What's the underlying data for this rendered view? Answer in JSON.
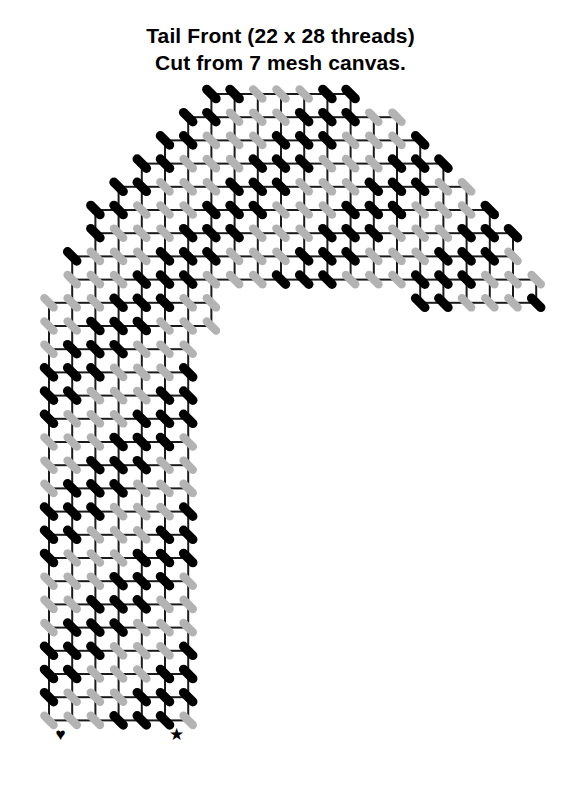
{
  "title": {
    "line1": "Tail Front (22 x 28 threads)",
    "line2": "Cut from 7 mesh canvas."
  },
  "legend": {
    "heart_symbol": "♥",
    "star_symbol": "★"
  },
  "colors": {
    "grid_line": "#1a1a1a",
    "stitch_dark": "#000000",
    "stitch_light": "#b3b3b3",
    "cell_fill": "#ffffff",
    "background": "#ffffff",
    "text": "#000000"
  },
  "chart_data": {
    "type": "heatmap",
    "title": "Tail Front (22 x 28 threads)",
    "subtitle": "Cut from 7 mesh canvas.",
    "shape": "candy-cane",
    "grid_columns": 22,
    "grid_rows": 28,
    "cell_size_px": 23.2,
    "origin_x_px": 49,
    "origin_y_px": 94,
    "mesh": "7 mesh canvas",
    "legend_entries": [
      {
        "symbol": "♥",
        "name": "heart-marker",
        "column": 0
      },
      {
        "symbol": "★",
        "name": "star-marker",
        "column": 5
      }
    ],
    "stitch_orientation": "diagonal NW-SE at grid intersections",
    "stripe_period_rows": 6,
    "shape_mask_rows": [
      {
        "row": 0,
        "start": 7,
        "end": 13
      },
      {
        "row": 1,
        "start": 6,
        "end": 15
      },
      {
        "row": 2,
        "start": 5,
        "end": 16
      },
      {
        "row": 3,
        "start": 4,
        "end": 17
      },
      {
        "row": 4,
        "start": 3,
        "end": 18
      },
      {
        "row": 5,
        "start": 2,
        "end": 19
      },
      {
        "row": 6,
        "start": 2,
        "end": 20
      },
      {
        "row": 7,
        "start": 1,
        "end": 20
      },
      {
        "row": 8,
        "start": 1,
        "end": 21,
        "hole_start": 7,
        "hole_end": 16
      },
      {
        "row": 9,
        "start": 0,
        "end": 7,
        "hole_start": 7,
        "hole_end": 21
      },
      {
        "row": 10,
        "start": 0,
        "end": 6,
        "hole_start": 6,
        "hole_end": 21
      },
      {
        "row": 11,
        "start": 0,
        "end": 6
      },
      {
        "row": 12,
        "start": 0,
        "end": 6
      },
      {
        "row": 13,
        "start": 0,
        "end": 6
      },
      {
        "row": 14,
        "start": 0,
        "end": 6
      },
      {
        "row": 15,
        "start": 0,
        "end": 6
      },
      {
        "row": 16,
        "start": 0,
        "end": 6
      },
      {
        "row": 17,
        "start": 0,
        "end": 6
      },
      {
        "row": 18,
        "start": 0,
        "end": 6
      },
      {
        "row": 19,
        "start": 0,
        "end": 6
      },
      {
        "row": 20,
        "start": 0,
        "end": 6
      },
      {
        "row": 21,
        "start": 0,
        "end": 6
      },
      {
        "row": 22,
        "start": 0,
        "end": 6
      },
      {
        "row": 23,
        "start": 0,
        "end": 6
      },
      {
        "row": 24,
        "start": 0,
        "end": 6
      },
      {
        "row": 25,
        "start": 0,
        "end": 6
      },
      {
        "row": 26,
        "start": 0,
        "end": 6
      }
    ],
    "dark_stripe_offsets": [
      0,
      1,
      2
    ]
  }
}
